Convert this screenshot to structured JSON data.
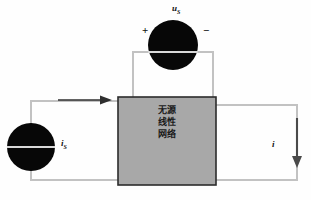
{
  "diagram": {
    "network_box": {
      "line1": "无源",
      "line2": "线性",
      "line3": "网络",
      "fill_color": "#a8a8a8",
      "border_color": "#2b2b2b"
    },
    "labels": {
      "source_voltage": "u",
      "source_voltage_sub": "S",
      "source_current": "i",
      "source_current_sub": "S",
      "response_current": "i",
      "terminal_positive": "+",
      "terminal_negative": "−"
    },
    "elements": {
      "voltage_source_name": "voltage-source-symbol",
      "current_source_name": "current-source-symbol",
      "input_arrow_name": "input-current-arrow",
      "output_arrow_name": "output-current-arrow"
    },
    "colors": {
      "wire": "#bdbdbd",
      "source_fill": "#050505",
      "arrow": "#3b3b3b",
      "text": "#111111"
    }
  }
}
